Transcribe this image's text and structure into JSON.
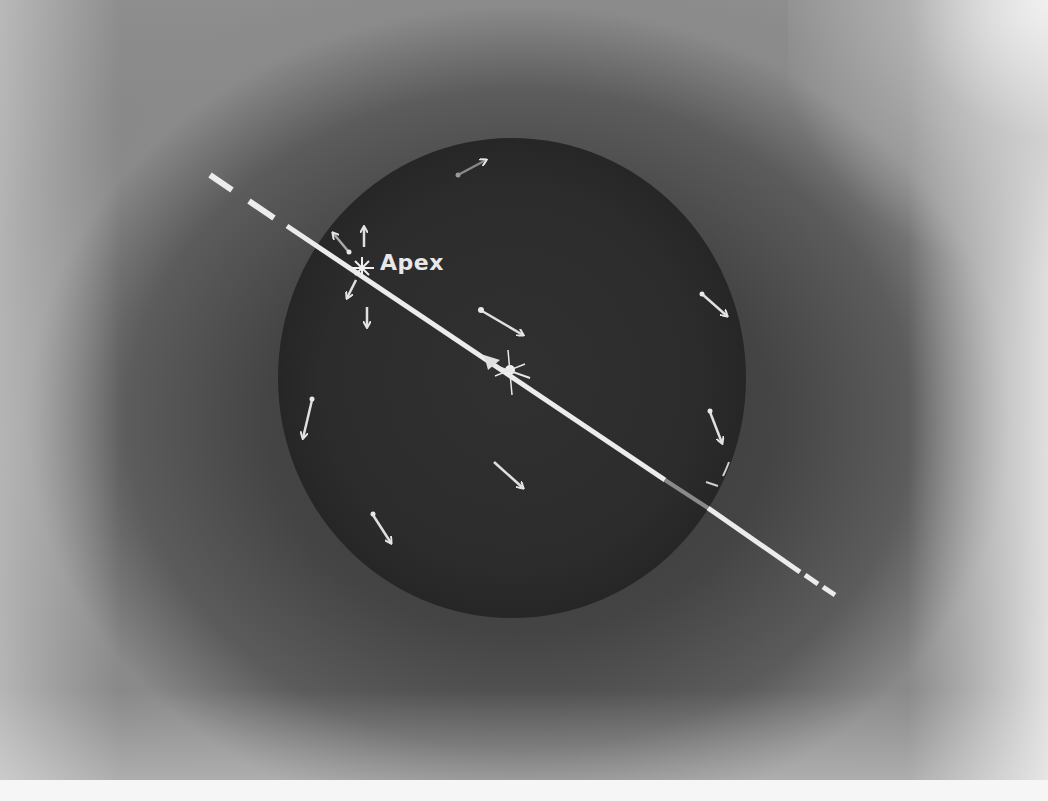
{
  "figure": {
    "labels": {
      "apex": "Apex"
    },
    "colors": {
      "background_gray": "#7a7a7a",
      "sphere_dark": "#2e2e2e",
      "line_white": "#ececec",
      "paper_white": "#f4f4f4"
    },
    "sphere": {
      "cx": 512,
      "cy": 378,
      "rx": 234,
      "ry": 240
    },
    "axis_line": {
      "from": [
        210,
        175
      ],
      "to": [
        835,
        595
      ],
      "style": "dashed outside sphere, solid inside"
    },
    "apex_point": [
      362,
      268
    ],
    "antapex_point": [
      510,
      370
    ],
    "motion_arrows": [
      {
        "from": [
          458,
          175
        ],
        "to": [
          486,
          160
        ],
        "note": "top"
      },
      {
        "from": [
          702,
          294
        ],
        "to": [
          727,
          316
        ],
        "note": "right upper"
      },
      {
        "from": [
          482,
          311
        ],
        "to": [
          523,
          335
        ],
        "note": "center"
      },
      {
        "from": [
          312,
          400
        ],
        "to": [
          303,
          438
        ],
        "note": "left"
      },
      {
        "from": [
          710,
          412
        ],
        "to": [
          722,
          443
        ],
        "note": "right"
      },
      {
        "from": [
          494,
          462
        ],
        "to": [
          523,
          488
        ],
        "note": "lower center"
      },
      {
        "from": [
          373,
          515
        ],
        "to": [
          391,
          543
        ],
        "note": "lower left"
      },
      {
        "from": [
          348,
          251
        ],
        "to": [
          333,
          233
        ],
        "note": "apex upper-left"
      },
      {
        "from": [
          364,
          247
        ],
        "to": [
          364,
          227
        ],
        "note": "apex up"
      },
      {
        "from": [
          356,
          280
        ],
        "to": [
          347,
          298
        ],
        "note": "apex lower-left"
      },
      {
        "from": [
          367,
          307
        ],
        "to": [
          367,
          327
        ],
        "note": "apex down"
      }
    ]
  }
}
